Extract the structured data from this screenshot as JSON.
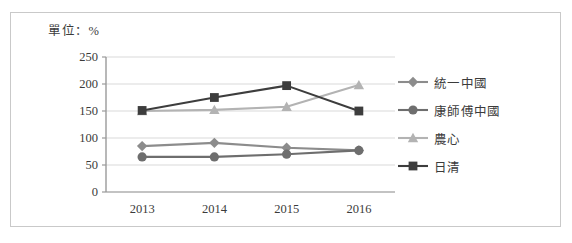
{
  "figure": {
    "unit_label": "單位：%",
    "border_color": "#c9c9c9",
    "background": "#ffffff"
  },
  "legend": {
    "position": "right",
    "items": [
      {
        "label": "統一中國",
        "marker": "diamond-icon",
        "color": "#8c8c8c"
      },
      {
        "label": "康師傅中國",
        "marker": "circle-icon",
        "color": "#6e6e6e"
      },
      {
        "label": "農心",
        "marker": "triangle-icon",
        "color": "#b3b3b3"
      },
      {
        "label": "日清",
        "marker": "square-icon",
        "color": "#3d3d3d"
      }
    ]
  },
  "axes": {
    "y_ticks": [
      250,
      200,
      150,
      100,
      50,
      0
    ],
    "x_ticks": [
      "2013",
      "2014",
      "2015",
      "2016"
    ],
    "gridline_color": "#d9d9d9",
    "axis_color": "#9a9a9a"
  },
  "chart_data": {
    "type": "line",
    "title": "",
    "subtitle": "",
    "xlabel": "",
    "ylabel": "單位：%",
    "categories": [
      "2013",
      "2014",
      "2015",
      "2016"
    ],
    "ylim": [
      0,
      250
    ],
    "ytick_step": 50,
    "grid": true,
    "legend_position": "right",
    "series": [
      {
        "name": "統一中國",
        "marker": "diamond",
        "color": "#8c8c8c",
        "values": [
          85,
          91,
          82,
          77
        ]
      },
      {
        "name": "康師傅中國",
        "marker": "circle",
        "color": "#6e6e6e",
        "values": [
          65,
          65,
          70,
          77
        ]
      },
      {
        "name": "農心",
        "marker": "triangle",
        "color": "#b3b3b3",
        "values": [
          150,
          152,
          158,
          198
        ]
      },
      {
        "name": "日清",
        "marker": "square",
        "color": "#3d3d3d",
        "values": [
          151,
          175,
          197,
          150
        ]
      }
    ]
  }
}
